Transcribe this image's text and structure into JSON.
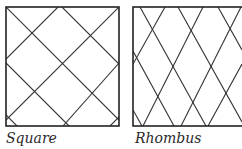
{
  "figure": {
    "stroke_color": "#333333",
    "panels": [
      {
        "id": "square",
        "caption": "Square",
        "box": {
          "x": 6,
          "y": 7,
          "w": 113,
          "h": 119
        },
        "lines": [
          [
            6,
            7,
            119,
            120
          ],
          [
            6,
            63,
            69,
            126
          ],
          [
            62,
            7,
            119,
            64
          ],
          [
            58,
            7,
            6,
            59
          ],
          [
            119,
            7,
            6,
            120
          ],
          [
            119,
            63,
            63,
            126
          ],
          [
            6,
            115,
            17,
            126
          ],
          [
            110,
            126,
            119,
            117
          ]
        ]
      },
      {
        "id": "rhombus",
        "caption": "Rhombus",
        "box": {
          "x": 133,
          "y": 7,
          "w": 112,
          "h": 119
        },
        "lines": [
          [
            140,
            7,
            206,
            126
          ],
          [
            178,
            7,
            242,
            122
          ],
          [
            218,
            7,
            242,
            50
          ],
          [
            133,
            51,
            174,
            126
          ],
          [
            165,
            7,
            133,
            64
          ],
          [
            203,
            7,
            143,
            126
          ],
          [
            241,
            7,
            181,
            126
          ],
          [
            242,
            64,
            208,
            126
          ],
          [
            133,
            110,
            142,
            126
          ]
        ]
      }
    ]
  }
}
